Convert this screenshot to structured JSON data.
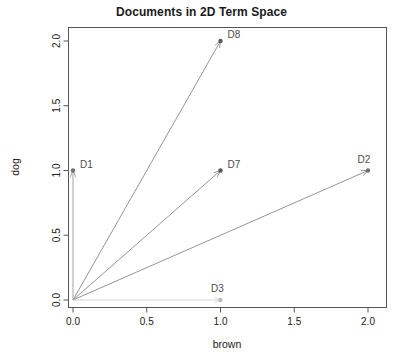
{
  "chart_data": {
    "type": "scatter",
    "title": "Documents in 2D Term Space",
    "xlabel": "brown",
    "ylabel": "dog",
    "xlim": [
      0.0,
      2.1
    ],
    "ylim": [
      0.0,
      2.1
    ],
    "xticks": [
      "0.0",
      "0.5",
      "1.0",
      "1.5",
      "2.0"
    ],
    "xtick_values": [
      0.0,
      0.5,
      1.0,
      1.5,
      2.0
    ],
    "yticks": [
      "0.0",
      "0.5",
      "1.0",
      "1.5",
      "2.0"
    ],
    "ytick_values": [
      0.0,
      0.5,
      1.0,
      1.5,
      2.0
    ],
    "grid": false,
    "legend": "none",
    "origin": [
      0.0,
      0.0
    ],
    "points": [
      {
        "label": "D1",
        "x": 0.0,
        "y": 1.0,
        "color": "#707070",
        "label_dx": 7,
        "label_dy": -3
      },
      {
        "label": "D8",
        "x": 1.0,
        "y": 2.0,
        "color": "#595959",
        "label_dx": 7,
        "label_dy": -3
      },
      {
        "label": "D7",
        "x": 1.0,
        "y": 1.0,
        "color": "#595959",
        "label_dx": 7,
        "label_dy": -3
      },
      {
        "label": "D2",
        "x": 2.0,
        "y": 1.0,
        "color": "#707070",
        "label_dx": -4,
        "label_dy": -8
      },
      {
        "label": "D3",
        "x": 1.0,
        "y": 0.0,
        "color": "#bdbdbd",
        "label_dx": -3,
        "label_dy": -8
      }
    ],
    "vectors": [
      {
        "label": "D1",
        "from": [
          0.0,
          0.0
        ],
        "to": [
          0.0,
          1.0
        ],
        "color": "#9a9a9a"
      },
      {
        "label": "D8",
        "from": [
          0.0,
          0.0
        ],
        "to": [
          1.0,
          2.0
        ],
        "color": "#8a8a8a"
      },
      {
        "label": "D7",
        "from": [
          0.0,
          0.0
        ],
        "to": [
          1.0,
          1.0
        ],
        "color": "#8a8a8a"
      },
      {
        "label": "D2",
        "from": [
          0.0,
          0.0
        ],
        "to": [
          2.0,
          1.0
        ],
        "color": "#8a8a8a"
      },
      {
        "label": "D3",
        "from": [
          0.0,
          0.0
        ],
        "to": [
          1.0,
          0.0
        ],
        "color": "#d2d2d2"
      }
    ]
  }
}
